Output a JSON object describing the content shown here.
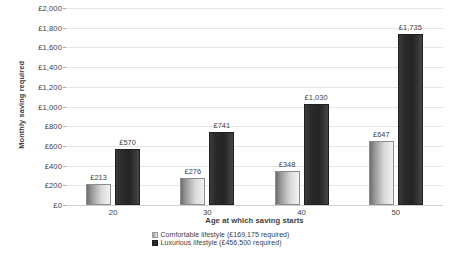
{
  "chart_data": {
    "type": "bar",
    "title": "",
    "xlabel": "Age at which saving starts",
    "ylabel": "Monthly saving required",
    "categories": [
      "20",
      "30",
      "40",
      "50"
    ],
    "ylim": [
      0,
      2000
    ],
    "ytick_step": 200,
    "ytick_labels": [
      "£0",
      "£200",
      "£400",
      "£600",
      "£800",
      "£1,000",
      "£1,200",
      "£1,400",
      "£1,600",
      "£1,800",
      "£2,000"
    ],
    "ytick_values": [
      0,
      200,
      400,
      600,
      800,
      1000,
      1200,
      1400,
      1600,
      1800,
      2000
    ],
    "grid": true,
    "legend_position": "bottom",
    "currency_symbol": "£",
    "series": [
      {
        "name": "Comfortable lifestyle (£169,175 required)",
        "short_name": "Comfortable lifestyle",
        "required_total": "£169,175",
        "color": "#c8c8c8",
        "values": [
          213,
          276,
          348,
          647
        ],
        "labels": [
          "£213",
          "£276",
          "£348",
          "£647"
        ]
      },
      {
        "name": "Luxurious lifestyle (£456,500 required)",
        "short_name": "Luxurious lifestyle",
        "required_total": "£456,500",
        "color": "#2b2b2b",
        "values": [
          570,
          741,
          1030,
          1735
        ],
        "labels": [
          "£570",
          "£741",
          "£1,030",
          "£1,735"
        ]
      }
    ]
  }
}
